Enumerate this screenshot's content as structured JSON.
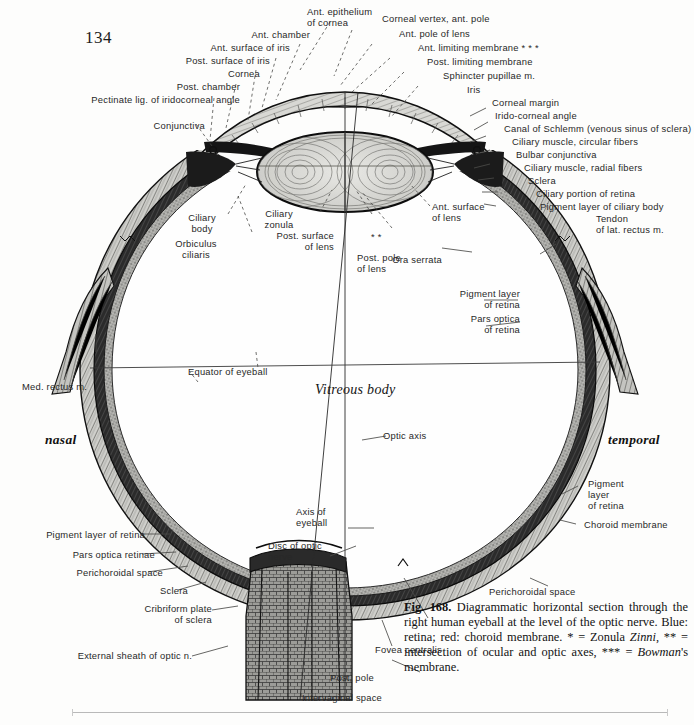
{
  "page": {
    "number": "134",
    "background": "#fdfdfc",
    "ink": "#1a1a1a"
  },
  "figure": {
    "title": "Diagrammatic horizontal section through the right human eyeball",
    "orientation_left": "nasal",
    "orientation_right": "temporal",
    "interior_label": "Vitreous body"
  },
  "caption": {
    "number": "Fig. 168.",
    "body": "Diagrammatic horizontal section through the right human eyeball at the level of the optic nerve. Blue: retina; red: choroid membrane.",
    "footnote_prefix": "* = Zonula ",
    "footnote_italic1": "Zinni",
    "footnote_mid": ", ** = intersection of ocular and optic axes, *** = ",
    "footnote_italic2": "Bowman",
    "footnote_suffix": "'s membrane."
  },
  "labels_top_left": [
    {
      "id": "ant-chamber",
      "text": "Ant. chamber"
    },
    {
      "id": "ant-surface-iris",
      "text": "Ant. surface of iris"
    },
    {
      "id": "post-surface-iris",
      "text": "Post. surface of iris"
    },
    {
      "id": "cornea",
      "text": "Cornea"
    },
    {
      "id": "post-chamber",
      "text": "Post. chamber"
    },
    {
      "id": "pectinate-lig",
      "text": "Pectinate lig. of iridocorneal angle"
    },
    {
      "id": "conjunctiva",
      "text": "Conjunctiva"
    }
  ],
  "labels_top_center": [
    {
      "id": "ant-epithelium-cornea",
      "line1": "Ant. epithelium",
      "line2": "of cornea"
    },
    {
      "id": "corneal-vertex",
      "text": "Corneal vertex, ant. pole"
    },
    {
      "id": "ant-pole-lens",
      "text": "Ant. pole of lens"
    }
  ],
  "labels_top_right": [
    {
      "id": "ant-limiting-membrane",
      "text": "Ant. limiting membrane * * *"
    },
    {
      "id": "post-limiting-membrane",
      "text": "Post. limiting membrane"
    },
    {
      "id": "sphincter-pupillae",
      "text": "Sphincter pupillae m."
    },
    {
      "id": "iris",
      "text": "Iris"
    },
    {
      "id": "corneal-margin",
      "text": "Corneal margin"
    },
    {
      "id": "irido-corneal-angle",
      "text": "Irido-corneal angle"
    },
    {
      "id": "canal-of-schlemm",
      "text": "Canal of Schlemm (venous sinus of sclera)"
    },
    {
      "id": "ciliary-muscle-circular",
      "text": "Ciliary muscle, circular fibers"
    },
    {
      "id": "bulbar-conjunctiva",
      "text": "Bulbar conjunctiva"
    },
    {
      "id": "ciliary-muscle-radial",
      "text": "Ciliary muscle, radial fibers"
    },
    {
      "id": "sclera-top",
      "text": "Sclera"
    },
    {
      "id": "ciliary-portion-retina",
      "text": "Ciliary portion of retina"
    },
    {
      "id": "pigment-layer-ciliary-body",
      "text": "Pigment layer of ciliary body"
    }
  ],
  "labels_mid": [
    {
      "id": "ciliary-body",
      "line1": "Ciliary",
      "line2": "body"
    },
    {
      "id": "orbiculus-ciliaris",
      "line1": "Orbiculus",
      "line2": "ciliaris"
    },
    {
      "id": "ciliary-zonula",
      "line1": "Ciliary",
      "line2": "zonula"
    },
    {
      "id": "post-surface-lens",
      "line1": "Post. surface",
      "line2": "of lens"
    },
    {
      "id": "asterisk-two",
      "text": "* *"
    },
    {
      "id": "post-pole-lens",
      "line1": "Post. pole",
      "line2": "of lens"
    },
    {
      "id": "ant-surface-lens",
      "line1": "Ant. surface",
      "line2": "of lens"
    },
    {
      "id": "tendon-lat-rectus",
      "line1": "Tendon",
      "line2": "of lat. rectus m."
    },
    {
      "id": "ora-serrata",
      "text": "Ora serrata"
    },
    {
      "id": "pigment-layer-retina-right",
      "line1": "Pigment layer",
      "line2": "of retina"
    },
    {
      "id": "pars-optica-retina-right",
      "line1": "Pars optica",
      "line2": "of retina"
    }
  ],
  "labels_equator": [
    {
      "id": "med-rectus",
      "text": "Med. rectus m."
    },
    {
      "id": "equator-of-eyeball",
      "text": "Equator of eyeball"
    },
    {
      "id": "optic-axis",
      "text": "Optic axis"
    }
  ],
  "labels_lower_right": [
    {
      "id": "pigment-layer-retina-lower",
      "line1": "Pigment",
      "line2": "layer",
      "line3": "of retina"
    },
    {
      "id": "choroid-membrane",
      "text": "Choroid membrane"
    },
    {
      "id": "perichoroidal-space-right",
      "text": "Perichoroidal space"
    }
  ],
  "labels_lower_left": [
    {
      "id": "pigment-layer-retina-left",
      "text": "Pigment layer of retina"
    },
    {
      "id": "pars-optica-retinae",
      "text": "Pars optica retinae"
    },
    {
      "id": "perichoroidal-space-left",
      "text": "Perichoroidal space"
    },
    {
      "id": "sclera-lower",
      "text": "Sclera"
    },
    {
      "id": "cribriform-plate",
      "line1": "Cribriform plate",
      "line2": "of sclera"
    },
    {
      "id": "external-sheath-optic-n",
      "text": "External sheath of optic n."
    }
  ],
  "labels_bottom": [
    {
      "id": "axis-of-eyeball",
      "line1": "Axis of",
      "line2": "eyeball"
    },
    {
      "id": "disc-of-optic-nerve",
      "line1": "Disc of optic",
      "line2": "nerve"
    },
    {
      "id": "fovea-centralis",
      "text": "Fovea centralis"
    },
    {
      "id": "post-pole",
      "text": "Post. pole"
    },
    {
      "id": "intervaginal-space",
      "text": "Intervaginal space"
    }
  ]
}
